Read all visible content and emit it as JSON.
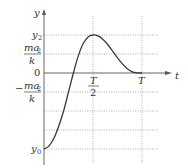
{
  "chart_data": {
    "type": "line",
    "title": "",
    "xlabel": "t",
    "ylabel": "y",
    "x_ticks": [
      {
        "value": 0.5,
        "label": "T/2"
      },
      {
        "value": 1.0,
        "label": "T"
      }
    ],
    "y_ticks": [
      {
        "value": 2.0,
        "label": "y2"
      },
      {
        "value": 1.0,
        "label": "ma2/k"
      },
      {
        "value": 0.0,
        "label": "0"
      },
      {
        "value": -1.0,
        "label": "-ma2/k"
      },
      {
        "value": -4.0,
        "label": "y0"
      }
    ],
    "extra_grid_y": [
      -2.0,
      -3.0
    ],
    "xlim": [
      0,
      1.25
    ],
    "ylim": [
      -4.7,
      3.6
    ],
    "series": [
      {
        "name": "y(t)",
        "x": [
          0,
          0.05,
          0.1,
          0.15,
          0.2,
          0.25,
          0.3,
          0.35,
          0.4,
          0.45,
          0.5,
          0.55,
          0.6,
          0.65,
          0.7,
          0.75,
          0.8,
          0.85,
          0.9,
          0.95,
          1.0
        ],
        "y": [
          -4.0,
          -3.85,
          -3.45,
          -2.8,
          -2.0,
          -1.0,
          0.0,
          0.9,
          1.55,
          1.9,
          2.0,
          1.95,
          1.78,
          1.5,
          1.15,
          0.8,
          0.48,
          0.22,
          0.06,
          0.01,
          0.0
        ]
      }
    ]
  },
  "labels": {
    "y_axis": "y",
    "t_axis": "t",
    "y2_main": "y",
    "y2_sub": "2",
    "ma_num": "ma",
    "ma_sub": "2",
    "ma_den": "k",
    "zero": "0",
    "neg_sign": "−",
    "neg_num": "ma",
    "neg_sub": "2",
    "neg_den": "k",
    "y0_main": "y",
    "y0_sub": "0",
    "half_num": "T",
    "half_den": "2",
    "T": "T"
  }
}
